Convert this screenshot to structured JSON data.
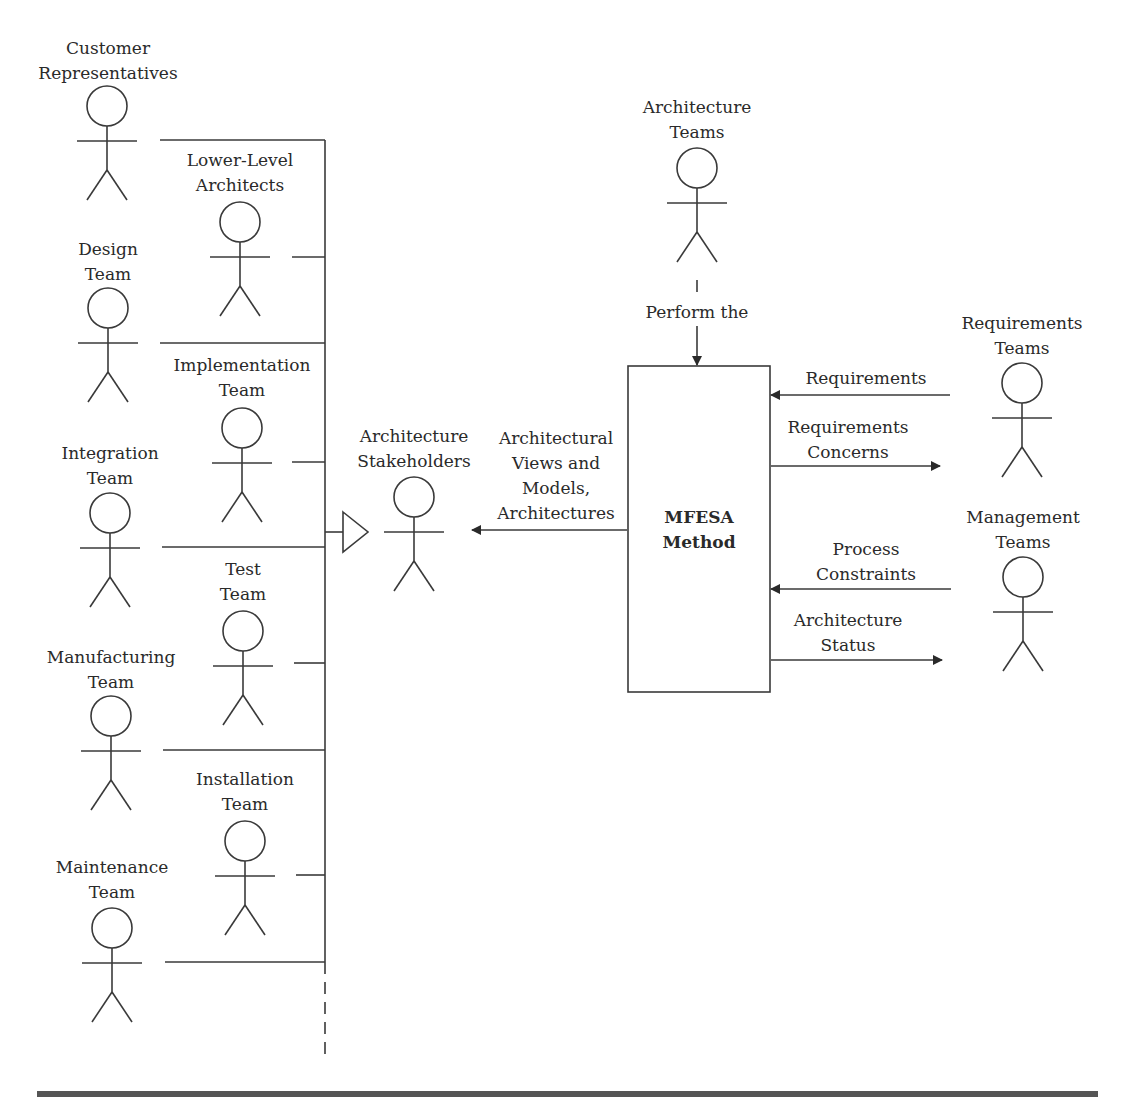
{
  "diagram": {
    "type": "use-case-context",
    "stakeholder_actors": [
      {
        "id": "customer-representatives",
        "lines": [
          "Customer",
          "Representatives"
        ],
        "x": 110,
        "y": 36
      },
      {
        "id": "lower-level-architects",
        "lines": [
          "Lower-Level",
          "Architects"
        ],
        "x": 240,
        "y": 148
      },
      {
        "id": "design-team",
        "lines": [
          "Design",
          "Team"
        ],
        "x": 108,
        "y": 237
      },
      {
        "id": "implementation-team",
        "lines": [
          "Implementation",
          "Team"
        ],
        "x": 242,
        "y": 354
      },
      {
        "id": "integration-team",
        "lines": [
          "Integration",
          "Team"
        ],
        "x": 110,
        "y": 442
      },
      {
        "id": "test-team",
        "lines": [
          "Test",
          "Team"
        ],
        "x": 243,
        "y": 558
      },
      {
        "id": "manufacturing-team",
        "lines": [
          "Manufacturing",
          "Team"
        ],
        "x": 111,
        "y": 646
      },
      {
        "id": "installation-team",
        "lines": [
          "Installation",
          "Team"
        ],
        "x": 245,
        "y": 768
      },
      {
        "id": "maintenance-team",
        "lines": [
          "Maintenance",
          "Team"
        ],
        "x": 112,
        "y": 856
      }
    ],
    "generalization_target": {
      "id": "architecture-stakeholders",
      "lines": [
        "Architecture",
        "Stakeholders"
      ],
      "x": 414,
      "y": 424
    },
    "method_box": {
      "lines": [
        "MFESA",
        "Method"
      ]
    },
    "architecture_teams": {
      "lines": [
        "Architecture",
        "Teams"
      ],
      "x": 697,
      "y": 96
    },
    "requirements_teams": {
      "lines": [
        "Requirements",
        "Teams"
      ],
      "x": 1022,
      "y": 312
    },
    "management_teams": {
      "lines": [
        "Management",
        "Teams"
      ],
      "x": 1023,
      "y": 506
    },
    "flows": {
      "perform": {
        "lines": [
          "Perform the"
        ],
        "x": 697,
        "y": 301
      },
      "architectural_outputs": {
        "lines": [
          "Architectural",
          "Views and",
          "Models,",
          "Architectures"
        ],
        "x": 556,
        "y": 426
      },
      "requirements": {
        "lines": [
          "Requirements"
        ],
        "x": 866,
        "y": 367
      },
      "requirements_concerns": {
        "lines": [
          "Requirements",
          "Concerns"
        ],
        "x": 848,
        "y": 416
      },
      "process_constraints": {
        "lines": [
          "Process",
          "Constraints"
        ],
        "x": 866,
        "y": 538
      },
      "architecture_status": {
        "lines": [
          "Architecture",
          "Status"
        ],
        "x": 848,
        "y": 609
      }
    }
  },
  "colors": {
    "line": "#3a3a3a",
    "text": "#2a2a2a",
    "footer_rule": "#555555"
  }
}
